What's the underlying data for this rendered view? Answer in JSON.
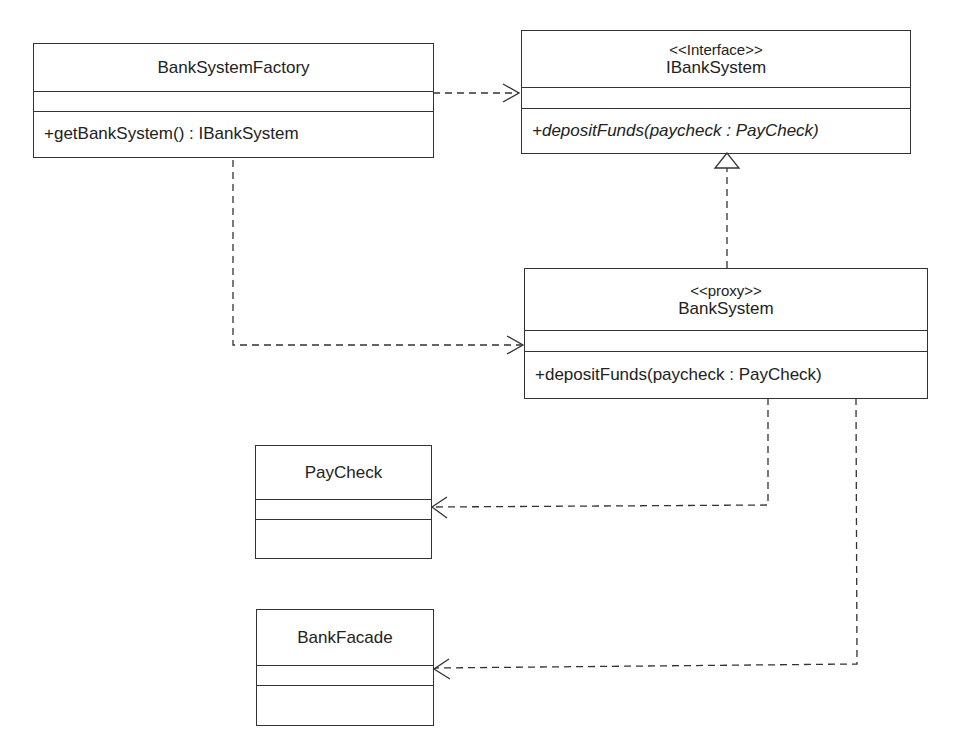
{
  "diagram": {
    "type": "UML class diagram",
    "classes": [
      {
        "id": "bank-system-factory",
        "stereotype": "",
        "name": "BankSystemFactory",
        "attributes": [],
        "operations": [
          {
            "text": "+getBankSystem() : IBankSystem",
            "abstract": false
          }
        ]
      },
      {
        "id": "ibank-system",
        "stereotype": "<<Interface>>",
        "name": "IBankSystem",
        "attributes": [],
        "operations": [
          {
            "text": "+depositFunds(paycheck : PayCheck)",
            "abstract": true
          }
        ]
      },
      {
        "id": "bank-system",
        "stereotype": "<<proxy>>",
        "name": "BankSystem",
        "attributes": [],
        "operations": [
          {
            "text": "+depositFunds(paycheck : PayCheck)",
            "abstract": false
          }
        ]
      },
      {
        "id": "paycheck",
        "stereotype": "",
        "name": "PayCheck",
        "attributes": [],
        "operations": []
      },
      {
        "id": "bank-facade",
        "stereotype": "",
        "name": "BankFacade",
        "attributes": [],
        "operations": []
      }
    ],
    "relationships": [
      {
        "from": "BankSystemFactory",
        "to": "IBankSystem",
        "type": "dependency"
      },
      {
        "from": "BankSystemFactory",
        "to": "BankSystem",
        "type": "dependency"
      },
      {
        "from": "BankSystem",
        "to": "IBankSystem",
        "type": "realization"
      },
      {
        "from": "BankSystem",
        "to": "PayCheck",
        "type": "dependency"
      },
      {
        "from": "BankSystem",
        "to": "BankFacade",
        "type": "dependency"
      }
    ],
    "colors": {
      "line": "#333333",
      "background": "#ffffff",
      "text": "#222222"
    }
  }
}
